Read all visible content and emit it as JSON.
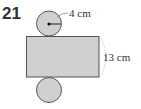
{
  "problem": {
    "number": "21"
  },
  "diagram": {
    "type": "cylinder-net",
    "radius_label": "4 cm",
    "height_label": "13 cm",
    "colors": {
      "fill": "#d0d0d0",
      "stroke": "#555555",
      "dimension": "#bbbbbb"
    }
  }
}
